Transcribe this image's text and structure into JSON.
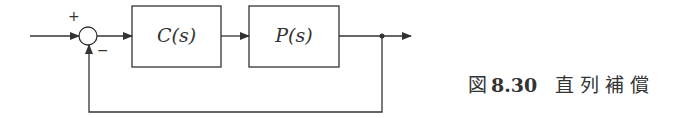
{
  "diagram": {
    "type": "block-diagram",
    "blocks": [
      {
        "id": "controller",
        "label": "C(s)"
      },
      {
        "id": "plant",
        "label": "P(s)"
      }
    ],
    "summing_junction": {
      "plus_sign": "+",
      "minus_sign": "−"
    },
    "connections": [
      "input -> summing_junction (+)",
      "summing_junction -> C(s)",
      "C(s) -> P(s)",
      "P(s) -> output",
      "output -> summing_junction (−) [feedback]"
    ]
  },
  "caption": {
    "prefix": "図",
    "number": "8.30",
    "title": "直列補償"
  }
}
